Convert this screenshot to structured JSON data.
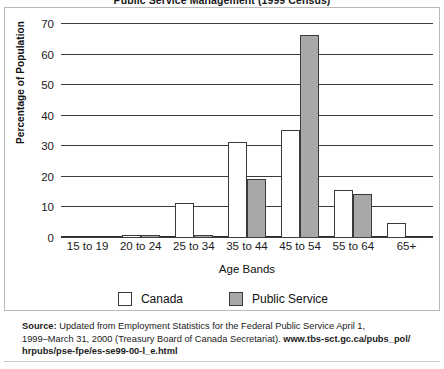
{
  "title": "Public Service Management (1999 Census)",
  "axis": {
    "ylabel": "Percentage of Population",
    "xlabel": "Age Bands",
    "yticks": [
      "70",
      "60",
      "50",
      "40",
      "30",
      "20",
      "10",
      "0"
    ]
  },
  "legend": {
    "canada_label": "Canada",
    "public_service_label": "Public Service"
  },
  "source": {
    "label": "Source:",
    "line1": " Updated from Employment Statistics for the Federal Public Service April 1,",
    "line2": "1999–March 31, 2000 (Treasury Board of Canada Secretariat). ",
    "url1": "www.tbs-sct.gc.ca/pubs_pol/",
    "url2": "hrpubs/pse-fpe/es-se99-00-l_e.html"
  },
  "colors": {
    "canada_fill": "#ffffff",
    "public_service_fill": "#a8a8a8",
    "bar_stroke": "#3a3a3a",
    "gridline": "#3d3d3d",
    "panel_border": "#b9b9b9"
  },
  "chart_data": {
    "type": "bar",
    "title": "Public Service Management (1999 Census)",
    "xlabel": "Age Bands",
    "ylabel": "Percentage of Population",
    "ylim": [
      0,
      70
    ],
    "ytick_step": 10,
    "grid": true,
    "legend_position": "bottom",
    "categories": [
      "15 to 19",
      "20 to 24",
      "25 to 34",
      "35 to 44",
      "45 to 54",
      "55 to 64",
      "65+"
    ],
    "series": [
      {
        "name": "Canada",
        "values": [
          0,
          0.8,
          11,
          31,
          35,
          15.5,
          4.5
        ]
      },
      {
        "name": "Public Service",
        "values": [
          0,
          0.4,
          0.5,
          19,
          66,
          14,
          0
        ]
      }
    ]
  }
}
